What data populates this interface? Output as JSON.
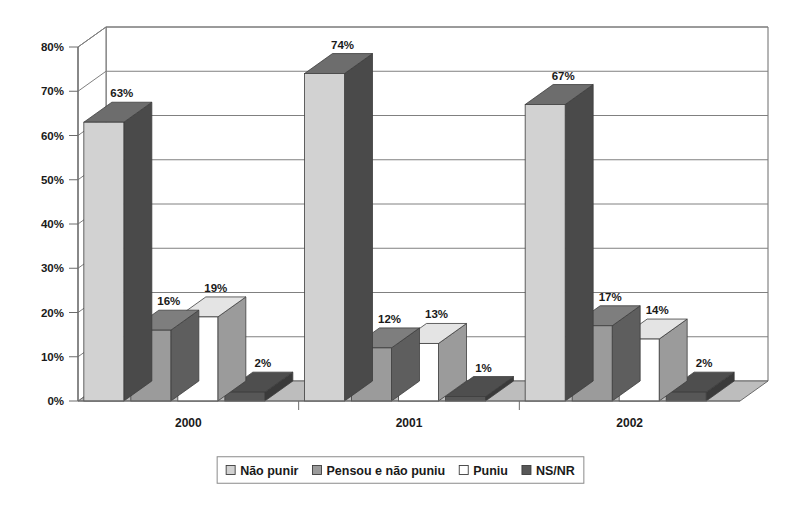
{
  "chart_data": {
    "type": "bar",
    "title": "",
    "subtitle": "",
    "xlabel": "",
    "ylabel": "",
    "categories": [
      "2000",
      "2001",
      "2002"
    ],
    "series": [
      {
        "name": "Não punir",
        "values": [
          63,
          16,
          67
        ],
        "color": "#d2d2d2",
        "side_color": "#4a4a4a",
        "top_color": "#6d6d6d"
      },
      {
        "name": "Pensou e não puniu",
        "values": [
          16,
          12,
          17
        ],
        "color": "#9b9b9b",
        "side_color": "#5e5e5e",
        "top_color": "#7e7e7e"
      },
      {
        "name": "Puniu",
        "values": [
          19,
          13,
          14
        ],
        "color": "#ffffff",
        "side_color": "#9b9b9b",
        "top_color": "#e4e4e4"
      },
      {
        "name": "NS/NR",
        "values": [
          2,
          1,
          2
        ],
        "color": "#575757",
        "side_color": "#3a3a3a",
        "top_color": "#4e4e4e"
      }
    ],
    "series_by_category": [
      {
        "category": "2000",
        "values": [
          63,
          16,
          19,
          2
        ],
        "labels": [
          "63%",
          "16%",
          "19%",
          "2%"
        ]
      },
      {
        "category": "2001",
        "values": [
          74,
          12,
          13,
          1
        ],
        "labels": [
          "74%",
          "12%",
          "13%",
          "1%"
        ]
      },
      {
        "category": "2002",
        "values": [
          67,
          17,
          14,
          2
        ],
        "labels": [
          "67%",
          "17%",
          "14%",
          "2%"
        ]
      }
    ],
    "ylim": [
      0,
      80
    ],
    "ytick_values": [
      0,
      10,
      20,
      30,
      40,
      50,
      60,
      70,
      80
    ],
    "ytick_labels": [
      "0%",
      "10%",
      "20%",
      "30%",
      "40%",
      "50%",
      "60%",
      "70%",
      "80%"
    ],
    "grid": true,
    "legend_position": "bottom",
    "legend_entries": [
      "Não punir",
      "Pensou e não puniu",
      "Puniu",
      "NS/NR"
    ],
    "value_labels": [
      "63%",
      "16%",
      "19%",
      "2%",
      "74%",
      "12%",
      "13%",
      "1%",
      "67%",
      "17%",
      "14%",
      "2%"
    ],
    "note": "Series 1 value for 2000 is 63 and for 2001 is 74; see series_by_category for the authoritative per-group ordering."
  },
  "legend": {
    "items": [
      {
        "label": "Não punir",
        "swatch": "#d2d2d2"
      },
      {
        "label": "Pensou e não puniu",
        "swatch": "#9b9b9b"
      },
      {
        "label": "Puniu",
        "swatch": "#ffffff"
      },
      {
        "label": "NS/NR",
        "swatch": "#575757"
      }
    ]
  },
  "colors": {
    "background": "#ffffff",
    "axis_line": "#6b6b6b",
    "gridline": "#808080",
    "text": "#1a1a1a",
    "floor": "#bdbdbd",
    "legend_border": "#8a8a8a"
  }
}
